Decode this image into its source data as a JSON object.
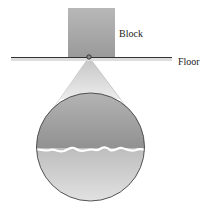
{
  "diagram": {
    "labels": {
      "block": "Block",
      "floor": "Floor"
    },
    "elements": [
      {
        "name": "block",
        "description": "gray square block resting on floor"
      },
      {
        "name": "floor",
        "description": "horizontal floor line"
      },
      {
        "name": "contact-point",
        "description": "small circle marking contact region"
      },
      {
        "name": "magnified-view",
        "description": "circular magnified view of rough contact interface"
      }
    ],
    "colors": {
      "block": "#a9a9a9",
      "floor_line": "#333333",
      "upper_surface": "#9c9c9c",
      "lower_surface": "#c8c8c8",
      "interface_gap": "#ffffff",
      "outline": "#444444"
    }
  }
}
